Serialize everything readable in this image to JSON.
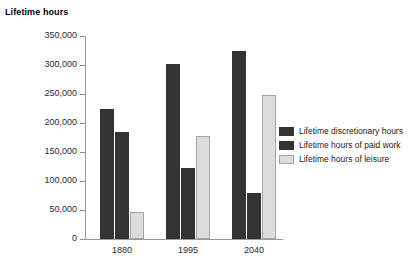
{
  "chart_data": {
    "type": "bar",
    "title": "",
    "ylabel": "Lifetime hours",
    "xlabel": "",
    "ylim": [
      0,
      350000
    ],
    "grid": false,
    "legend_position": "right",
    "categories": [
      "1880",
      "1995",
      "2040"
    ],
    "y_ticks": [
      "0",
      "50,000",
      "100,000",
      "150,000",
      "200,000",
      "250,000",
      "300,000",
      "350,000"
    ],
    "y_tick_values": [
      0,
      50000,
      100000,
      150000,
      200000,
      250000,
      300000,
      350000
    ],
    "series": [
      {
        "name": "Lifetime discretionary hours",
        "color": "#333333",
        "values": [
          225000,
          302000,
          325000
        ]
      },
      {
        "name": "Lifetime hours of paid work",
        "color": "#333333",
        "values": [
          185000,
          123000,
          80000
        ]
      },
      {
        "name": "Lifetime hours of leisure",
        "color": "#dcdcdc",
        "values": [
          46000,
          178000,
          249000
        ]
      }
    ]
  },
  "axis": {
    "y_title": "Lifetime hours"
  },
  "legend": {
    "items": [
      {
        "label": "Lifetime discretionary hours",
        "swatch": "dark"
      },
      {
        "label": "Lifetime hours of paid work",
        "swatch": "dark"
      },
      {
        "label": "Lifetime hours of leisure",
        "swatch": "light"
      }
    ]
  }
}
